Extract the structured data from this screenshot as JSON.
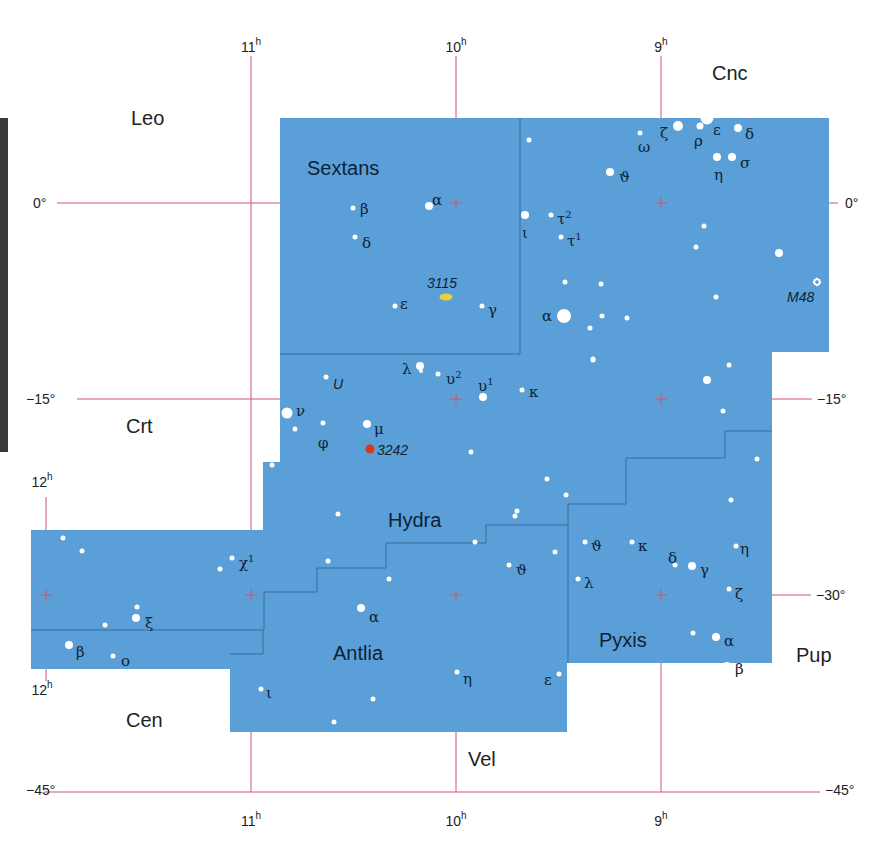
{
  "colors": {
    "region_fill": "#5b9fd9",
    "boundary": "#3d6a97",
    "grid": "#d2546e",
    "star": "#ffffff",
    "nebula_3115": "#e8d23a",
    "nebula_3242": "#d23a1a",
    "label": "#0e2236"
  },
  "axes": {
    "ra_top": [
      {
        "value": "11",
        "unit": "h",
        "x": 251
      },
      {
        "value": "10",
        "unit": "h",
        "x": 456
      },
      {
        "value": "9",
        "unit": "h",
        "x": 661
      }
    ],
    "ra_bottom": [
      {
        "value": "11",
        "unit": "h",
        "x": 251
      },
      {
        "value": "10",
        "unit": "h",
        "x": 456
      },
      {
        "value": "9",
        "unit": "h",
        "x": 661
      }
    ],
    "ra_left": [
      {
        "value": "12",
        "unit": "h",
        "y": 487
      },
      {
        "value": "12",
        "unit": "h",
        "y": 695
      }
    ],
    "dec_left": [
      {
        "label": "0°",
        "y": 203
      },
      {
        "label": "−15°",
        "y": 399
      },
      {
        "label": "−45°",
        "y": 790
      }
    ],
    "dec_right": [
      {
        "label": "0°",
        "y": 203
      },
      {
        "label": "−15°",
        "y": 399
      },
      {
        "label": "−30°",
        "y": 595
      },
      {
        "label": "−45°",
        "y": 790
      }
    ]
  },
  "constellations": [
    {
      "name": "Sextans",
      "x": 307,
      "y": 175
    },
    {
      "name": "Hydra",
      "x": 388,
      "y": 527
    },
    {
      "name": "Antlia",
      "x": 333,
      "y": 660
    },
    {
      "name": "Pyxis",
      "x": 599,
      "y": 647
    }
  ],
  "neighbors": [
    {
      "name": "Leo",
      "x": 131,
      "y": 125
    },
    {
      "name": "Cnc",
      "x": 712,
      "y": 80
    },
    {
      "name": "Crt",
      "x": 126,
      "y": 433
    },
    {
      "name": "Cen",
      "x": 126,
      "y": 727
    },
    {
      "name": "Vel",
      "x": 468,
      "y": 766
    },
    {
      "name": "Pup",
      "x": 796,
      "y": 662
    }
  ],
  "deep_sky": [
    {
      "id": "3115",
      "label": "3115",
      "type": "galaxy",
      "x": 446,
      "y": 297,
      "lx": 427,
      "ly": 288
    },
    {
      "id": "3242",
      "label": "3242",
      "type": "planetary-nebula",
      "x": 370,
      "y": 449,
      "lx": 377,
      "ly": 455
    },
    {
      "id": "M48",
      "label": "M48",
      "type": "open-cluster",
      "x": 817,
      "y": 282,
      "lx": 787,
      "ly": 302
    }
  ],
  "stars": [
    {
      "x": 429,
      "y": 206,
      "r": 4,
      "label": "α",
      "lx": 432,
      "ly": 200
    },
    {
      "x": 353,
      "y": 208,
      "r": 2.5,
      "label": "β",
      "lx": 360,
      "ly": 209
    },
    {
      "x": 355,
      "y": 237,
      "r": 2.5,
      "label": "δ",
      "lx": 362,
      "ly": 243
    },
    {
      "x": 395,
      "y": 306,
      "r": 2.5,
      "label": "ε",
      "lx": 400,
      "ly": 304
    },
    {
      "x": 482,
      "y": 306,
      "r": 2.5,
      "label": "γ",
      "lx": 488,
      "ly": 310
    },
    {
      "x": 525,
      "y": 215,
      "r": 4,
      "label": "ι",
      "lx": 522,
      "ly": 233
    },
    {
      "x": 551,
      "y": 215,
      "r": 2.5,
      "label": "τ",
      "sup": "2",
      "lx": 557,
      "ly": 219
    },
    {
      "x": 561,
      "y": 237,
      "r": 2.5,
      "label": "τ",
      "sup": "1",
      "lx": 567,
      "ly": 241
    },
    {
      "x": 529,
      "y": 140,
      "r": 2.5
    },
    {
      "x": 640,
      "y": 133,
      "r": 2.5,
      "label": "ω",
      "lx": 638,
      "ly": 147
    },
    {
      "x": 678,
      "y": 126,
      "r": 5,
      "label": "ζ",
      "lx": 660,
      "ly": 133
    },
    {
      "x": 700,
      "y": 126,
      "r": 3.5,
      "label": "ρ",
      "lx": 694,
      "ly": 141
    },
    {
      "x": 707,
      "y": 118,
      "r": 6.5,
      "label": "ε",
      "lx": 713,
      "ly": 130
    },
    {
      "x": 738,
      "y": 128,
      "r": 4,
      "label": "δ",
      "lx": 745,
      "ly": 134
    },
    {
      "x": 717,
      "y": 157,
      "r": 4,
      "label": "η",
      "lx": 714,
      "ly": 175
    },
    {
      "x": 732,
      "y": 157,
      "r": 4,
      "label": "σ",
      "lx": 740,
      "ly": 163
    },
    {
      "x": 610,
      "y": 172,
      "r": 4,
      "label": "ϑ",
      "lx": 619,
      "ly": 177
    },
    {
      "x": 564,
      "y": 316,
      "r": 7,
      "label": "α",
      "lx": 542,
      "ly": 316
    },
    {
      "x": 565,
      "y": 282,
      "r": 2.5
    },
    {
      "x": 601,
      "y": 284,
      "r": 2.5
    },
    {
      "x": 602,
      "y": 316,
      "r": 2.5
    },
    {
      "x": 627,
      "y": 318,
      "r": 2.5
    },
    {
      "x": 590,
      "y": 328,
      "r": 2.5
    },
    {
      "x": 593,
      "y": 359,
      "r": 2.5
    },
    {
      "x": 704,
      "y": 226,
      "r": 2.5
    },
    {
      "x": 696,
      "y": 247,
      "r": 2.5
    },
    {
      "x": 779,
      "y": 253,
      "r": 4
    },
    {
      "x": 716,
      "y": 297,
      "r": 2.5
    },
    {
      "x": 707,
      "y": 380,
      "r": 4
    },
    {
      "x": 729,
      "y": 365,
      "r": 2.5
    },
    {
      "x": 723,
      "y": 411,
      "r": 2.5
    },
    {
      "x": 757,
      "y": 459,
      "r": 2.5
    },
    {
      "x": 731,
      "y": 500,
      "r": 2.5
    },
    {
      "x": 593,
      "y": 360,
      "r": 2.5
    },
    {
      "x": 420,
      "y": 366,
      "r": 4,
      "label": "λ",
      "lx": 402,
      "ly": 369
    },
    {
      "x": 421,
      "y": 371,
      "r": 2
    },
    {
      "x": 438,
      "y": 374,
      "r": 2.5,
      "label": "υ",
      "sup": "2",
      "lx": 446,
      "ly": 379
    },
    {
      "x": 483,
      "y": 397,
      "r": 4,
      "label": "υ",
      "sup": "1",
      "lx": 478,
      "ly": 386
    },
    {
      "x": 522,
      "y": 390,
      "r": 2.5,
      "label": "κ",
      "lx": 529,
      "ly": 392
    },
    {
      "x": 326,
      "y": 377,
      "r": 2.5,
      "label": "U",
      "lx": 333,
      "ly": 384,
      "italic": true
    },
    {
      "x": 287,
      "y": 413,
      "r": 5.5,
      "label": "ν",
      "lx": 296,
      "ly": 411
    },
    {
      "x": 323,
      "y": 423,
      "r": 2.5,
      "label": "φ",
      "lx": 318,
      "ly": 443
    },
    {
      "x": 295,
      "y": 429,
      "r": 2.5
    },
    {
      "x": 367,
      "y": 424,
      "r": 4,
      "label": "μ",
      "lx": 374,
      "ly": 429
    },
    {
      "x": 471,
      "y": 452,
      "r": 2.5
    },
    {
      "x": 547,
      "y": 479,
      "r": 2.5
    },
    {
      "x": 566,
      "y": 495,
      "r": 2.5
    },
    {
      "x": 517,
      "y": 511,
      "r": 2.5
    },
    {
      "x": 515,
      "y": 516,
      "r": 2.5
    },
    {
      "x": 272,
      "y": 465,
      "r": 2.5
    },
    {
      "x": 338,
      "y": 514,
      "r": 2.5
    },
    {
      "x": 328,
      "y": 561,
      "r": 2.5
    },
    {
      "x": 389,
      "y": 579,
      "r": 2.5
    },
    {
      "x": 475,
      "y": 542,
      "r": 2.5
    },
    {
      "x": 555,
      "y": 552,
      "r": 2.5
    },
    {
      "x": 509,
      "y": 565,
      "r": 2.5,
      "label": "ϑ",
      "lx": 516,
      "ly": 570
    },
    {
      "x": 361,
      "y": 608,
      "r": 4,
      "label": "α",
      "lx": 369,
      "ly": 617
    },
    {
      "x": 261,
      "y": 689,
      "r": 2.5,
      "label": "ι",
      "lx": 266,
      "ly": 693
    },
    {
      "x": 373,
      "y": 699,
      "r": 2.5
    },
    {
      "x": 334,
      "y": 722,
      "r": 2.5
    },
    {
      "x": 457,
      "y": 672,
      "r": 2.5,
      "label": "η",
      "lx": 463,
      "ly": 679
    },
    {
      "x": 559,
      "y": 674,
      "r": 2.5,
      "label": "ε",
      "lx": 544,
      "ly": 680
    },
    {
      "x": 585,
      "y": 542,
      "r": 2.5,
      "label": "ϑ",
      "lx": 591,
      "ly": 546
    },
    {
      "x": 632,
      "y": 542,
      "r": 2.5,
      "label": "κ",
      "lx": 638,
      "ly": 546
    },
    {
      "x": 675,
      "y": 565,
      "r": 2.5,
      "label": "δ",
      "lx": 668,
      "ly": 558
    },
    {
      "x": 692,
      "y": 566,
      "r": 4,
      "label": "γ",
      "lx": 700,
      "ly": 570
    },
    {
      "x": 736,
      "y": 546,
      "r": 2.5,
      "label": "η",
      "lx": 740,
      "ly": 549
    },
    {
      "x": 578,
      "y": 579,
      "r": 2.5,
      "label": "λ",
      "lx": 584,
      "ly": 583
    },
    {
      "x": 729,
      "y": 589,
      "r": 2.5,
      "label": "ζ",
      "lx": 735,
      "ly": 594
    },
    {
      "x": 693,
      "y": 633,
      "r": 2.5
    },
    {
      "x": 716,
      "y": 637,
      "r": 4,
      "label": "α",
      "lx": 724,
      "ly": 641
    },
    {
      "x": 727,
      "y": 666,
      "r": 4,
      "label": "β",
      "lx": 735,
      "ly": 669
    },
    {
      "x": 220,
      "y": 569,
      "r": 2.5
    },
    {
      "x": 232,
      "y": 558,
      "r": 2.5,
      "label": "χ",
      "sup": "1",
      "lx": 239,
      "ly": 563
    },
    {
      "x": 63,
      "y": 538,
      "r": 2.5
    },
    {
      "x": 82,
      "y": 551,
      "r": 2.5
    },
    {
      "x": 137,
      "y": 607,
      "r": 2.5
    },
    {
      "x": 136,
      "y": 618,
      "r": 4,
      "label": "ξ",
      "lx": 145,
      "ly": 623
    },
    {
      "x": 105,
      "y": 625,
      "r": 2.5
    },
    {
      "x": 69,
      "y": 645,
      "r": 4,
      "label": "β",
      "lx": 76,
      "ly": 652
    },
    {
      "x": 113,
      "y": 656,
      "r": 2.5,
      "label": "ο",
      "lx": 121,
      "ly": 661
    }
  ]
}
